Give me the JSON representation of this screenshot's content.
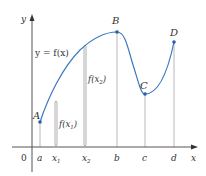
{
  "figure": {
    "type": "function-graph",
    "colors": {
      "curve": "#3a78c2",
      "point": "#2a5ea8",
      "axis": "#555555",
      "guide": "#b8b8b8",
      "text": "#333333"
    },
    "axes": {
      "x_label": "x",
      "y_label": "y",
      "origin_label": "0"
    },
    "curve_label": "y = f(x)",
    "points": [
      {
        "name": "A",
        "x_tick": "a"
      },
      {
        "name": "B",
        "x_tick": "b"
      },
      {
        "name": "C",
        "x_tick": "c"
      },
      {
        "name": "D",
        "x_tick": "d"
      }
    ],
    "x_ticks": [
      "a",
      "x1",
      "x2",
      "b",
      "c",
      "d"
    ],
    "tick_labels": {
      "a": "a",
      "x1_main": "x",
      "x1_sub": "1",
      "x2_main": "x",
      "x2_sub": "2",
      "b": "b",
      "c": "c",
      "d": "d"
    },
    "brackets": [
      {
        "label_main": "f(x",
        "label_sub": "1",
        "label_end": ")"
      },
      {
        "label_main": "f(x",
        "label_sub": "2",
        "label_end": ")"
      }
    ]
  }
}
